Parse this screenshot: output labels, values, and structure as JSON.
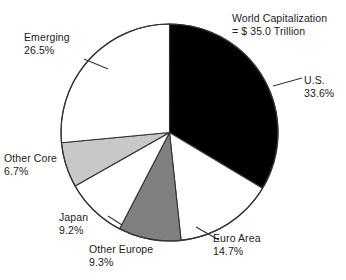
{
  "chart_data": {
    "type": "pie",
    "title": "World Capitalization",
    "subtitle": "= $ 35.0 Trillion",
    "title_line1": "World Capitalization",
    "title_line2": "= $ 35.0 Trillion",
    "total_value": "$ 35.0 Trillion",
    "categories": [
      "U.S.",
      "Euro Area",
      "Other Europe",
      "Japan",
      "Other Core",
      "Emerging"
    ],
    "values": [
      33.6,
      14.7,
      9.3,
      9.2,
      6.7,
      26.5
    ],
    "value_labels": [
      "33.6%",
      "14.7%",
      "9.3%",
      "9.2%",
      "6.7%",
      "26.5%"
    ],
    "colors": [
      "#000000",
      "#ffffff",
      "#808080",
      "#ffffff",
      "#c8c8c8",
      "#ffffff"
    ],
    "start_angle_deg": 0,
    "direction": "clockwise",
    "xlabel": "",
    "ylabel": "",
    "legend": "none",
    "grid": false,
    "slices": [
      {
        "name": "U.S.",
        "label": "U.S.",
        "percent_label": "33.6%",
        "value": 33.6,
        "color": "#000000",
        "leader_line": true
      },
      {
        "name": "Euro Area",
        "label": "Euro Area",
        "percent_label": "14.7%",
        "value": 14.7,
        "color": "#ffffff",
        "leader_line": true
      },
      {
        "name": "Other Europe",
        "label": "Other Europe",
        "percent_label": "9.3%",
        "value": 9.3,
        "color": "#808080",
        "leader_line": false
      },
      {
        "name": "Japan",
        "label": "Japan",
        "percent_label": "9.2%",
        "value": 9.2,
        "color": "#ffffff",
        "leader_line": true
      },
      {
        "name": "Other Core",
        "label": "Other Core",
        "percent_label": "6.7%",
        "value": 6.7,
        "color": "#c8c8c8",
        "leader_line": false
      },
      {
        "name": "Emerging",
        "label": "Emerging",
        "percent_label": "26.5%",
        "value": 26.5,
        "color": "#ffffff",
        "leader_line": true
      }
    ]
  },
  "colors": {
    "background": "#ffffff",
    "outline": "#333333",
    "text": "#1b1b1b",
    "slice_dark": "#000000",
    "slice_mid_gray": "#808080",
    "slice_light_gray": "#c8c8c8",
    "slice_white": "#ffffff"
  }
}
